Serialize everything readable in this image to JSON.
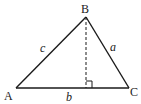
{
  "diagram": {
    "type": "triangle-with-altitude",
    "vertices": [
      {
        "id": "A",
        "label": "A",
        "x": 16,
        "y": 88
      },
      {
        "id": "B",
        "label": "B",
        "x": 86,
        "y": 17
      },
      {
        "id": "C",
        "label": "C",
        "x": 129,
        "y": 88
      }
    ],
    "sides": [
      {
        "id": "c",
        "label": "c",
        "from": "A",
        "to": "B"
      },
      {
        "id": "a",
        "label": "a",
        "from": "B",
        "to": "C"
      },
      {
        "id": "b",
        "label": "b",
        "from": "A",
        "to": "C"
      }
    ],
    "altitude": {
      "from": "B",
      "foot_x": 86,
      "foot_y": 88,
      "style": "dashed",
      "right_angle_marker": true
    },
    "colors": {
      "stroke": "#1a1a1a",
      "background": "#ffffff"
    }
  }
}
